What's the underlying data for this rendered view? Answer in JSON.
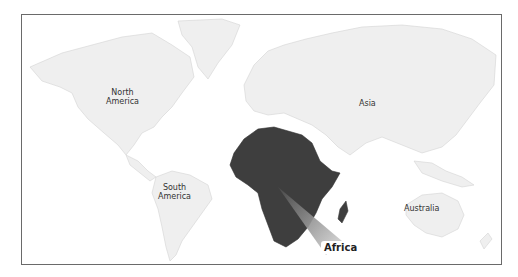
{
  "map": {
    "highlighted_region": "Africa",
    "colors": {
      "land": "#efefef",
      "land_border": "#d4d4d4",
      "highlight": "#3e3e3e",
      "frame": "#6a6a6a",
      "callout_start": "#555555",
      "callout_end": "#e0e0e0"
    },
    "labels": {
      "north_america_line1": "North",
      "north_america_line2": "America",
      "south_america_line1": "South",
      "south_america_line2": "America",
      "asia": "Asia",
      "australia": "Australia",
      "africa": "Africa"
    }
  }
}
